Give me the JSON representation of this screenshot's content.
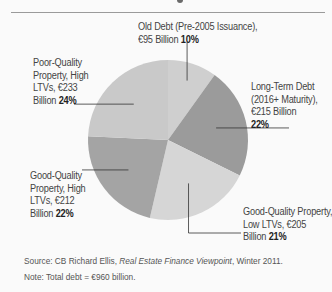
{
  "chart_data": {
    "type": "pie",
    "title": "",
    "start_angle": "12 o'clock",
    "direction": "clockwise",
    "slices": [
      {
        "label": "Old Debt (Pre-2005 Issuance)",
        "amount": "€95 Billion",
        "value_billion_eur": 95,
        "percent": 10,
        "percent_label": "10%",
        "color": "#cfcfcf"
      },
      {
        "label": "Long-Term Debt (2016+ Maturity)",
        "amount": "€215 Billion",
        "value_billion_eur": 215,
        "percent": 22,
        "percent_label": "22%",
        "color": "#9b9b9b"
      },
      {
        "label": "Good-Quality Property, Low LTVs",
        "amount": "€205 Billion",
        "value_billion_eur": 205,
        "percent": 21,
        "percent_label": "21%",
        "color": "#d6d6d6"
      },
      {
        "label": "Good-Quality Property, High LTVs",
        "amount": "€212 Billion",
        "value_billion_eur": 212,
        "percent": 22,
        "percent_label": "22%",
        "color": "#a4a4a4"
      },
      {
        "label": "Poor-Quality Property, High LTVs",
        "amount": "€233 Billion",
        "value_billion_eur": 233,
        "percent": 24,
        "percent_label": "24%",
        "color": "#c9c9c9"
      }
    ],
    "labels_text": {
      "old_debt": {
        "lines": [
          "Old Debt (Pre-2005 Issuance),",
          "€95 Billion"
        ],
        "pct": "10%"
      },
      "long_term": {
        "lines": [
          "Long-Term Debt",
          "(2016+ Maturity),",
          "€215 Billion"
        ],
        "pct": "22%"
      },
      "good_low": {
        "lines": [
          "Good-Quality Property,",
          "Low LTVs, €205",
          "Billion"
        ],
        "pct": "21%"
      },
      "good_high": {
        "lines": [
          "Good-Quality",
          "Property, High",
          "LTVs, €212",
          "Billion"
        ],
        "pct": "22%"
      },
      "poor_high": {
        "lines": [
          "Poor-Quality",
          "Property, High",
          "LTVs, €233",
          "Billion"
        ],
        "pct": "24%"
      }
    },
    "source": {
      "prefix": "Source: CB Richard Ellis, ",
      "publication": "Real Estate Finance Viewpoint",
      "suffix": ", Winter 2011."
    },
    "note": "Note: Total debt = €960 billion."
  }
}
